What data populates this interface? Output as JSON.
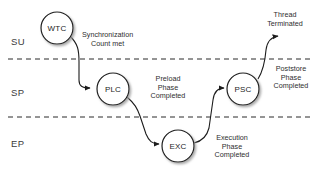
{
  "diagram": {
    "type": "swimlane-state-diagram",
    "width": 317,
    "height": 180,
    "background_color": "#ffffff",
    "line_color": "#1c1c1c",
    "node_fill_color": "#ffffff",
    "node_shadow_color": "#b4b4b4",
    "lane_divider_style": "dashed"
  },
  "lanes": [
    {
      "id": "su",
      "label": "SU",
      "label_x": 11,
      "label_y": 36,
      "divider_y": 59
    },
    {
      "id": "sp",
      "label": "SP",
      "label_x": 11,
      "label_y": 87,
      "divider_y": 117
    },
    {
      "id": "ep",
      "label": "EP",
      "label_x": 11,
      "label_y": 138,
      "divider_y": null
    }
  ],
  "nodes": [
    {
      "id": "wtc",
      "label": "WTC",
      "cx": 57,
      "cy": 28,
      "r": 16,
      "lane": "su"
    },
    {
      "id": "plc",
      "label": "PLC",
      "cx": 113,
      "cy": 89,
      "r": 16,
      "lane": "sp"
    },
    {
      "id": "exc",
      "label": "EXC",
      "cx": 178,
      "cy": 146,
      "r": 16,
      "lane": "ep"
    },
    {
      "id": "psc",
      "label": "PSC",
      "cx": 243,
      "cy": 89,
      "r": 16,
      "lane": "sp"
    }
  ],
  "transitions": [
    {
      "id": "wtc-to-plc",
      "from": "wtc",
      "to": "plc",
      "label_lines": [
        "Synchronization",
        "Count met"
      ],
      "label_x": 82,
      "label_y": 31,
      "label_align": "left"
    },
    {
      "id": "plc-to-exc",
      "from": "plc",
      "to": "exc",
      "label_lines": [
        "Preload",
        "Phase",
        "Completed"
      ],
      "label_x": 168,
      "label_y": 75,
      "label_align": "center"
    },
    {
      "id": "exc-to-psc",
      "from": "exc",
      "to": "psc",
      "label_lines": [
        "Execution",
        "Phase",
        "Completed"
      ],
      "label_x": 232,
      "label_y": 134,
      "label_align": "center"
    },
    {
      "id": "psc-to-end",
      "from": "psc",
      "to": "terminated",
      "label_lines": [
        "Poststore",
        "Phase",
        "Completed"
      ],
      "label_x": 291,
      "label_y": 65,
      "label_align": "center"
    }
  ],
  "terminals": [
    {
      "id": "terminated",
      "label_lines": [
        "Thread",
        "Terminated"
      ],
      "label_x": 285,
      "label_y": 11
    }
  ]
}
